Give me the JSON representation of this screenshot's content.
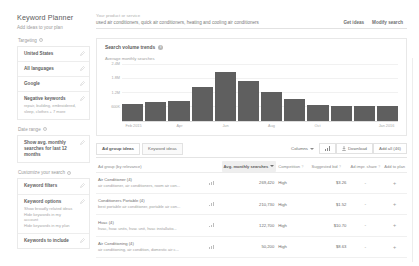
{
  "header": {
    "app_title": "Keyword Planner",
    "app_subtitle": "Add ideas to your plan",
    "search_label": "Your product or service",
    "search_value": "used air conditioners, quick air conditioners, heating and cooling air conditioners",
    "get_ideas_label": "Get ideas",
    "modify_search_label": "Modify search"
  },
  "sidebar": {
    "targeting_title": "Targeting",
    "targeting_items": [
      {
        "label": "United States",
        "sub": ""
      },
      {
        "label": "All languages",
        "sub": ""
      },
      {
        "label": "Google",
        "sub": ""
      },
      {
        "label": "Negative keywords",
        "sub": "repair, building, embroidered, sleep, clothes + 7 more"
      }
    ],
    "date_range_title": "Date range",
    "date_range_items": [
      {
        "label": "Show avg. monthly searches for last 12 months",
        "sub": ""
      }
    ],
    "customize_title": "Customize your search",
    "customize_items": [
      {
        "label": "Keyword filters",
        "sub": ""
      },
      {
        "label": "Keyword options",
        "sub": "Show broadly related ideas\nHide keywords in my account\nHide keywords in my plan"
      },
      {
        "label": "Keywords to include",
        "sub": ""
      }
    ]
  },
  "chart_panel": {
    "title": "Search volume trends",
    "info_glyph": "i"
  },
  "chart_data": {
    "type": "bar",
    "title": "Search volume trends",
    "ylabel": "Average monthly searches",
    "xlabel": "",
    "categories": [
      "Feb 2015",
      "Mar",
      "Apr",
      "May",
      "Jun",
      "Jul",
      "Aug",
      "Sep",
      "Oct",
      "Nov",
      "Dec",
      "Jan 2016"
    ],
    "tick_labels": [
      "Feb 2015",
      "Apr",
      "Jun",
      "Aug",
      "Oct",
      "Jan 2016"
    ],
    "tick_positions": [
      0,
      2,
      4,
      6,
      8,
      11
    ],
    "values": [
      680000,
      760000,
      820000,
      1400000,
      2050000,
      1650000,
      1180000,
      900000,
      640000,
      600000,
      610000,
      620000
    ],
    "yticks": [
      600000,
      1200000,
      1800000,
      2400000
    ],
    "ytick_labels": [
      "600K",
      "1.2M",
      "1.8M",
      "2.4M"
    ],
    "ylim": [
      0,
      2400000
    ],
    "grid": true,
    "legend": "none",
    "bar_color": "#5f5f5f"
  },
  "toolbar": {
    "tabs": [
      {
        "label": "Ad group ideas",
        "active": true
      },
      {
        "label": "Keyword ideas",
        "active": false
      }
    ],
    "columns_label": "Columns",
    "graph_icon_name": "bar-chart-icon",
    "download_label": "Download",
    "add_all_label": "Add all (46)"
  },
  "table": {
    "columns": [
      "Ad group (by relevance)",
      "Avg. monthly searches",
      "Competition",
      "Suggested bid",
      "Ad impr. share",
      "Add to plan"
    ],
    "rows": [
      {
        "group": "Air Conditioner (4)",
        "keywords": "air conditioner, air conditioners, room air con...",
        "searches": "269,420",
        "competition": "High",
        "bid": "$3.26",
        "impr_share": "-",
        "add": "+"
      },
      {
        "group": "Conditioners Portable (4)",
        "keywords": "best portable air conditioner, portable air con...",
        "searches": "210,730",
        "competition": "High",
        "bid": "$1.52",
        "impr_share": "-",
        "add": "+"
      },
      {
        "group": "Hvac (4)",
        "keywords": "hvac, hvac units, hvac unit, hvac installatio...",
        "searches": "122,700",
        "competition": "High",
        "bid": "$10.70",
        "impr_share": "-",
        "add": "+"
      },
      {
        "group": "Air Conditioning (4)",
        "keywords": "air conditioning, air condition, domestic air c...",
        "searches": "50,200",
        "competition": "High",
        "bid": "$8.63",
        "impr_share": "-",
        "add": "+"
      }
    ]
  }
}
